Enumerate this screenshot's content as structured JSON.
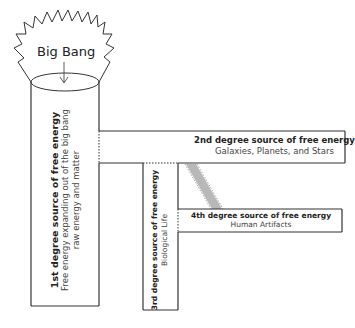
{
  "diagram": {
    "origin": {
      "label": "Big Bang"
    },
    "sources": [
      {
        "title": "1st degree source of free energy",
        "lines": [
          "Free energy expanding out of the big bang",
          "raw energy and matter"
        ]
      },
      {
        "title": "2nd degree source of free energy",
        "lines": [
          "Galaxies, Planets, and Stars"
        ]
      },
      {
        "title": "3rd degree source of free energy",
        "lines": [
          "Biological Life"
        ]
      },
      {
        "title": "4th degree source of free energy",
        "lines": [
          "Human Artifacts"
        ]
      }
    ],
    "colors": {
      "stroke": "#333333",
      "band": "#b8b8b8",
      "background": "#ffffff"
    }
  }
}
